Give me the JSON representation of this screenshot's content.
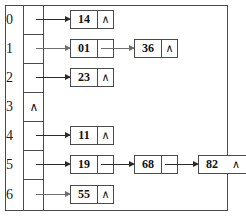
{
  "diagram": {
    "null_symbol": "∧",
    "colors": {
      "line": "#4a4a4a",
      "arrow": "#2b2b2b",
      "text": "#1a1a1a",
      "background": "#ffffff"
    },
    "buckets": [
      {
        "index": "0",
        "empty": false,
        "bucket_marker": "",
        "nodes": [
          {
            "value": "14",
            "next": "∧"
          }
        ]
      },
      {
        "index": "1",
        "empty": false,
        "bucket_marker": "",
        "nodes": [
          {
            "value": "01",
            "next": ""
          },
          {
            "value": "36",
            "next": "∧"
          }
        ]
      },
      {
        "index": "2",
        "empty": false,
        "bucket_marker": "",
        "nodes": [
          {
            "value": "23",
            "next": "∧"
          }
        ]
      },
      {
        "index": "3",
        "empty": true,
        "bucket_marker": "∧",
        "nodes": []
      },
      {
        "index": "4",
        "empty": false,
        "bucket_marker": "",
        "nodes": [
          {
            "value": "11",
            "next": "∧"
          }
        ]
      },
      {
        "index": "5",
        "empty": false,
        "bucket_marker": "",
        "nodes": [
          {
            "value": "19",
            "next": ""
          },
          {
            "value": "68",
            "next": ""
          },
          {
            "value": "82",
            "next": "∧"
          }
        ]
      },
      {
        "index": "6",
        "empty": false,
        "bucket_marker": "",
        "nodes": [
          {
            "value": "55",
            "next": "∧"
          }
        ]
      }
    ]
  }
}
